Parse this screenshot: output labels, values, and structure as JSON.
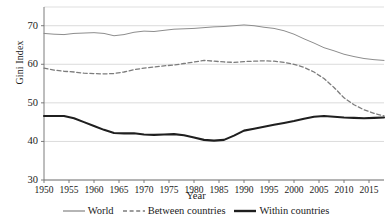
{
  "chart_data": {
    "type": "line",
    "title": "",
    "xlabel": "Year",
    "ylabel": "Gini Index",
    "xlim": [
      1950,
      2018
    ],
    "ylim": [
      30,
      72
    ],
    "grid": true,
    "legend_position": "bottom",
    "x_ticks": [
      "1950",
      "1955",
      "1960",
      "1965",
      "1970",
      "1975",
      "1980",
      "1985",
      "1990",
      "1995",
      "2000",
      "2005",
      "2010",
      "2015"
    ],
    "x_tick_values": [
      1950,
      1955,
      1960,
      1965,
      1970,
      1975,
      1980,
      1985,
      1990,
      1995,
      2000,
      2005,
      2010,
      2015
    ],
    "y_ticks": [
      "30",
      "40",
      "50",
      "60",
      "70"
    ],
    "y_tick_values": [
      30,
      40,
      50,
      60,
      70
    ],
    "x": [
      1950,
      1952,
      1954,
      1956,
      1958,
      1960,
      1962,
      1964,
      1966,
      1968,
      1970,
      1972,
      1974,
      1976,
      1978,
      1980,
      1982,
      1984,
      1986,
      1988,
      1990,
      1992,
      1994,
      1996,
      1998,
      2000,
      2002,
      2004,
      2006,
      2008,
      2010,
      2012,
      2014,
      2016,
      2018
    ],
    "series": [
      {
        "name": "World",
        "style": "solid-thin",
        "color": "#8d8d8d",
        "values": [
          68.0,
          67.8,
          67.7,
          68.0,
          68.1,
          68.2,
          68.0,
          67.4,
          67.7,
          68.3,
          68.6,
          68.5,
          68.8,
          69.1,
          69.2,
          69.3,
          69.5,
          69.7,
          69.8,
          70.0,
          70.2,
          70.0,
          69.6,
          69.3,
          68.7,
          67.8,
          66.6,
          65.5,
          64.3,
          63.5,
          62.6,
          62.0,
          61.5,
          61.2,
          61.0
        ]
      },
      {
        "name": "Between countries",
        "style": "dashed",
        "color": "#7c7c7c",
        "values": [
          59.0,
          58.5,
          58.2,
          58.0,
          57.7,
          57.6,
          57.5,
          57.6,
          58.0,
          58.6,
          59.0,
          59.3,
          59.6,
          59.8,
          60.2,
          60.6,
          61.0,
          60.8,
          60.6,
          60.5,
          60.7,
          60.8,
          60.9,
          60.8,
          60.5,
          60.0,
          59.2,
          58.0,
          56.3,
          54.0,
          51.3,
          49.5,
          48.2,
          47.3,
          46.6
        ]
      },
      {
        "name": "Within countries",
        "style": "solid-thick",
        "color": "#1f1f1f",
        "values": [
          46.6,
          46.6,
          46.6,
          46.0,
          45.0,
          44.0,
          43.0,
          42.2,
          42.1,
          42.1,
          41.8,
          41.7,
          41.8,
          41.9,
          41.6,
          41.0,
          40.4,
          40.2,
          40.4,
          41.5,
          42.8,
          43.3,
          43.8,
          44.3,
          44.8,
          45.3,
          45.9,
          46.4,
          46.6,
          46.4,
          46.2,
          46.1,
          46.0,
          46.1,
          46.2
        ]
      }
    ]
  },
  "legend": {
    "items": [
      {
        "label": "World",
        "swatch": "line-solid-thin-icon"
      },
      {
        "label": "Between countries",
        "swatch": "line-dashed-icon"
      },
      {
        "label": "Within countries",
        "swatch": "line-solid-thick-icon"
      }
    ]
  },
  "colors": {
    "grid": "#d7d7d7",
    "axis": "#6e6e6e",
    "world": "#8d8d8d",
    "between": "#7c7c7c",
    "within": "#1f1f1f"
  }
}
